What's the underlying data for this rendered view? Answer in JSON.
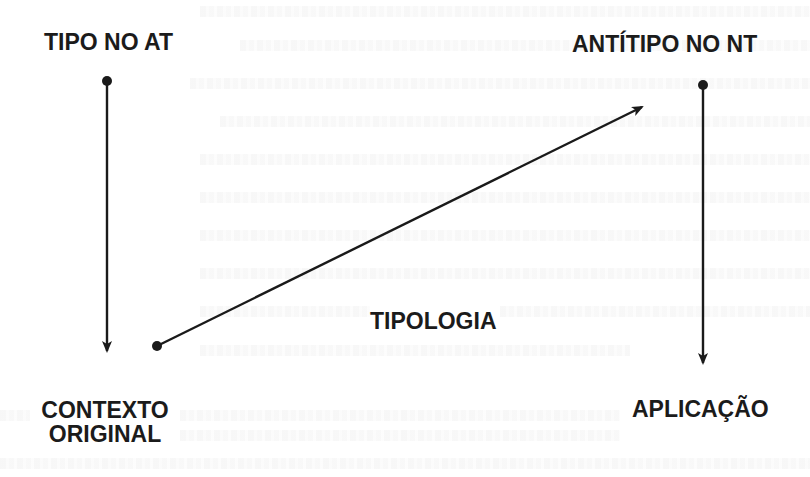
{
  "diagram": {
    "colors": {
      "stroke": "#1a1a1a",
      "text": "#1b1b1b",
      "background": "#ffffff"
    },
    "nodes": {
      "tipo_at": {
        "label": "TIPO NO AT"
      },
      "antitipo_nt": {
        "label": "ANTÍTIPO NO NT"
      },
      "contexto_original": {
        "line1": "CONTEXTO",
        "line2": "ORIGINAL"
      },
      "aplicacao": {
        "label": "APLICAÇÃO"
      }
    },
    "edges": [
      {
        "from": "TIPO NO AT",
        "to": "CONTEXTO ORIGINAL",
        "direction": "down"
      },
      {
        "from": "CONTEXTO ORIGINAL",
        "to": "ANTÍTIPO NO NT",
        "direction": "up-right",
        "label": "TIPOLOGIA"
      },
      {
        "from": "ANTÍTIPO NO NT",
        "to": "APLICAÇÃO",
        "direction": "down"
      }
    ],
    "edge_label": "TIPOLOGIA"
  }
}
